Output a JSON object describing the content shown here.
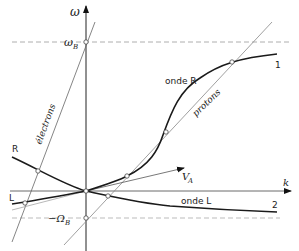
{
  "diagram": {
    "axes": {
      "y_label": "ω",
      "x_label": "k"
    },
    "levels": {
      "omega_B": "ω",
      "omega_B_sub": "B",
      "minus_Omega_B": "−Ω",
      "minus_Omega_B_sub": "B"
    },
    "lines": {
      "electrons": "électrons",
      "protons": "protons",
      "va": "V",
      "va_sub": "A"
    },
    "curves": {
      "onde_R": "onde R",
      "onde_L": "onde L",
      "R_label": "R",
      "L_label": "L",
      "branch_1": "1",
      "branch_2": "2"
    },
    "colors": {
      "curve": "#1a1a1a",
      "thin": "#666666",
      "dashed": "#999999"
    }
  }
}
